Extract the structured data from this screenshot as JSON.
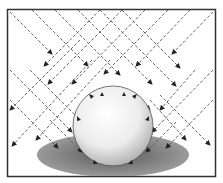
{
  "diagram": {
    "elements": {
      "frame": {
        "stroke": "#333333"
      },
      "sphere": {
        "cx": 113,
        "cy": 126,
        "r": 40,
        "highlight": "#ffffff",
        "shade": "#9a9a9a"
      },
      "shadow": {
        "cx": 113,
        "cy": 155,
        "rx": 76,
        "ry": 22,
        "color": "#8a8a8a"
      },
      "rays": {
        "color": "#555555",
        "style": "dashed",
        "directions": [
          "down-right",
          "down-left"
        ]
      }
    }
  }
}
